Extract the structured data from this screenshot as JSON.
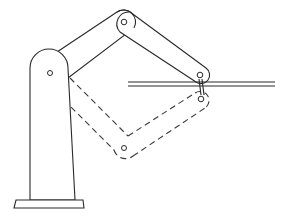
{
  "diagram": {
    "type": "robot-arm-linkage",
    "colors": {
      "background": "#ffffff",
      "line": "#2a2a2a"
    },
    "base": {
      "shape": "tapered pedestal with rounded top",
      "foot": "flat plate"
    },
    "joints": {
      "shoulder": {
        "x": 50,
        "y": 73
      },
      "elbow_solid": {
        "x": 124,
        "y": 22
      },
      "wrist_solid": {
        "x": 200,
        "y": 75
      },
      "elbow_dashed": {
        "x": 124,
        "y": 148
      },
      "wrist_dashed": {
        "x": 200,
        "y": 99
      }
    },
    "rail": {
      "x_start": 128,
      "x_end": 275,
      "y_top": 82,
      "y_bottom": 86
    },
    "poses": [
      {
        "name": "pose-solid",
        "style": "solid"
      },
      {
        "name": "pose-dashed",
        "style": "dashed"
      }
    ]
  }
}
